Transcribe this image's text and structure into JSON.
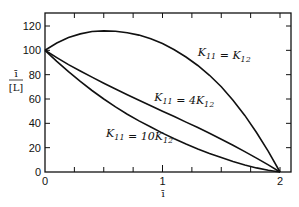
{
  "chart_data": {
    "type": "line",
    "title": "",
    "xlabel": "ī",
    "ylabel": "ī / [L]",
    "ylabel_numerator": "ī",
    "ylabel_denominator": "[L]",
    "xlim": [
      0,
      2
    ],
    "ylim": [
      0,
      130
    ],
    "x_ticks": [
      0,
      1,
      2
    ],
    "x_tick_labels": [
      "0",
      "1",
      "2"
    ],
    "y_ticks": [
      0,
      20,
      40,
      60,
      80,
      100,
      120
    ],
    "y_tick_labels": [
      "0",
      "20",
      "40",
      "60",
      "80",
      "100",
      "120"
    ],
    "grid": false,
    "legend": null,
    "series": [
      {
        "name": "K11 = K12",
        "annotation": {
          "main": "K",
          "sub1": "11",
          "eq": " = ",
          "main2": "K",
          "sub2": "12",
          "x": 1.3,
          "y": 95
        },
        "x": [
          0,
          0.1,
          0.2,
          0.3,
          0.4,
          0.5,
          0.6,
          0.7,
          0.8,
          0.9,
          1.0,
          1.1,
          1.2,
          1.3,
          1.4,
          1.5,
          1.6,
          1.7,
          1.8,
          1.9,
          2.0
        ],
        "y": [
          100,
          106,
          110.5,
          113.5,
          115.5,
          116,
          115.7,
          114.5,
          112.5,
          109.5,
          105.5,
          100.5,
          94.5,
          87.5,
          79.5,
          70,
          59,
          46.5,
          32.5,
          17,
          0
        ]
      },
      {
        "name": "K11 = 4K12",
        "annotation": {
          "main": "K",
          "sub1": "11",
          "eq": " = 4",
          "main2": "K",
          "sub2": "12",
          "x": 0.93,
          "y": 58
        },
        "x": [
          0,
          0.1,
          0.2,
          0.3,
          0.4,
          0.5,
          0.6,
          0.7,
          0.8,
          0.9,
          1.0,
          1.1,
          1.2,
          1.3,
          1.4,
          1.5,
          1.6,
          1.7,
          1.8,
          1.9,
          2.0
        ],
        "y": [
          100,
          94,
          88.3,
          83,
          78,
          73,
          68.2,
          63.5,
          59,
          54.5,
          50,
          45.5,
          41,
          36.5,
          31.8,
          27,
          22,
          16.8,
          11.4,
          5.8,
          0
        ]
      },
      {
        "name": "K11 = 10K12",
        "annotation": {
          "main": "K",
          "sub1": "11",
          "eq": " = 10",
          "main2": "K",
          "sub2": "12",
          "x": 0.52,
          "y": 29
        },
        "x": [
          0,
          0.1,
          0.2,
          0.3,
          0.4,
          0.5,
          0.6,
          0.7,
          0.8,
          0.9,
          1.0,
          1.1,
          1.2,
          1.3,
          1.4,
          1.5,
          1.6,
          1.7,
          1.8,
          1.9,
          2.0
        ],
        "y": [
          100,
          91,
          82.5,
          74.5,
          67,
          60,
          53.5,
          47.5,
          42,
          37,
          32,
          27.3,
          23,
          19,
          15.3,
          11.8,
          8.6,
          5.8,
          3.4,
          1.4,
          0
        ]
      }
    ],
    "colors": {
      "line": "#111111",
      "axis": "#111111",
      "background": "#ffffff"
    }
  }
}
